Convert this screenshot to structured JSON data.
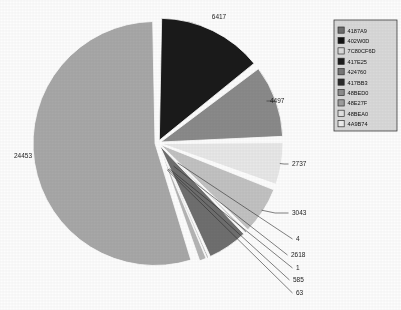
{
  "chart_data": {
    "type": "pie",
    "title": "",
    "subtitle": "",
    "xlabel": "",
    "ylabel": "",
    "grid": false,
    "legend_position": "top-right",
    "data_label_style": "value-with-leader-line",
    "exploded": true,
    "total": 44418,
    "categories": [
      "4187A9",
      "402W0D",
      "7C80CF6D",
      "417E25",
      "424760",
      "417BB3",
      "48BED0",
      "48E27F",
      "48BEA0",
      "4A9B74"
    ],
    "values": [
      6417,
      4497,
      2737,
      3043,
      4,
      2618,
      1,
      585,
      63,
      24453
    ],
    "slice_colors": [
      "#1a1a1a",
      "#8a8a8a",
      "#e8e8e8",
      "#c2c2c2",
      "#2e2e2e",
      "#6f6f6f",
      "#222222",
      "#b5b5b5",
      "#9a9a9a",
      "#a8a8a8"
    ],
    "labels": [
      {
        "value": "6417",
        "category": "4187A9"
      },
      {
        "value": "4497",
        "category": "402W0D"
      },
      {
        "value": "2737",
        "category": "7C80CF6D"
      },
      {
        "value": "3043",
        "category": "417E25"
      },
      {
        "value": "4",
        "category": "424760"
      },
      {
        "value": "2618",
        "category": "417BB3"
      },
      {
        "value": "1",
        "category": "48BED0"
      },
      {
        "value": "585",
        "category": "48E27F"
      },
      {
        "value": "63",
        "category": "48BEA0"
      },
      {
        "value": "24453",
        "category": "4A9B74"
      }
    ]
  },
  "legend": {
    "items": [
      {
        "label": "4187A9",
        "swatch": "#6e6e6e"
      },
      {
        "label": "402W0D",
        "swatch": "#141414"
      },
      {
        "label": "7C80CF6D",
        "swatch": "#dcdcdc"
      },
      {
        "label": "417E25",
        "swatch": "#1d1d1d"
      },
      {
        "label": "424760",
        "swatch": "#777777"
      },
      {
        "label": "417BB3",
        "swatch": "#2a2a2a"
      },
      {
        "label": "48BED0",
        "swatch": "#8d8d8d"
      },
      {
        "label": "48E27F",
        "swatch": "#9e9e9e"
      },
      {
        "label": "48BEA0",
        "swatch": "#e2e2e2"
      },
      {
        "label": "4A9B74",
        "swatch": "#ededed"
      }
    ],
    "border_color": "#3a3a3a",
    "background_color": "#d9d9d9"
  },
  "colors": {
    "page_background": "#fdfdfd",
    "text": "#1c1c1c",
    "leader_line": "#2b2b2b",
    "slice_gap": "#ffffff"
  }
}
